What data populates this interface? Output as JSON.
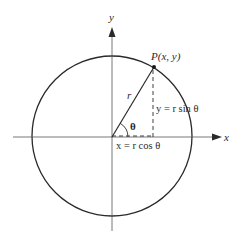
{
  "diagram": {
    "colors": {
      "background": "#ffffff",
      "stroke": "#2a2a2a",
      "axis": "#555555"
    },
    "axes": {
      "x_label": "x",
      "y_label": "y"
    },
    "point": {
      "label": "P(x, y)"
    },
    "radius_label": "r",
    "angle_label": "θ",
    "equations": {
      "y_equation": "y = r sin θ",
      "x_equation": "x = r cos θ"
    }
  }
}
